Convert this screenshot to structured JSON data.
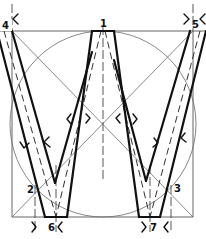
{
  "labels": {
    "p1": "1",
    "p2": "2",
    "p3": "3",
    "p4": "4",
    "p5": "5",
    "p6": "6",
    "p7": "7"
  },
  "colors": {
    "background": "#ffffff",
    "stroke": "#111111",
    "guide": "#6a6a6a"
  }
}
